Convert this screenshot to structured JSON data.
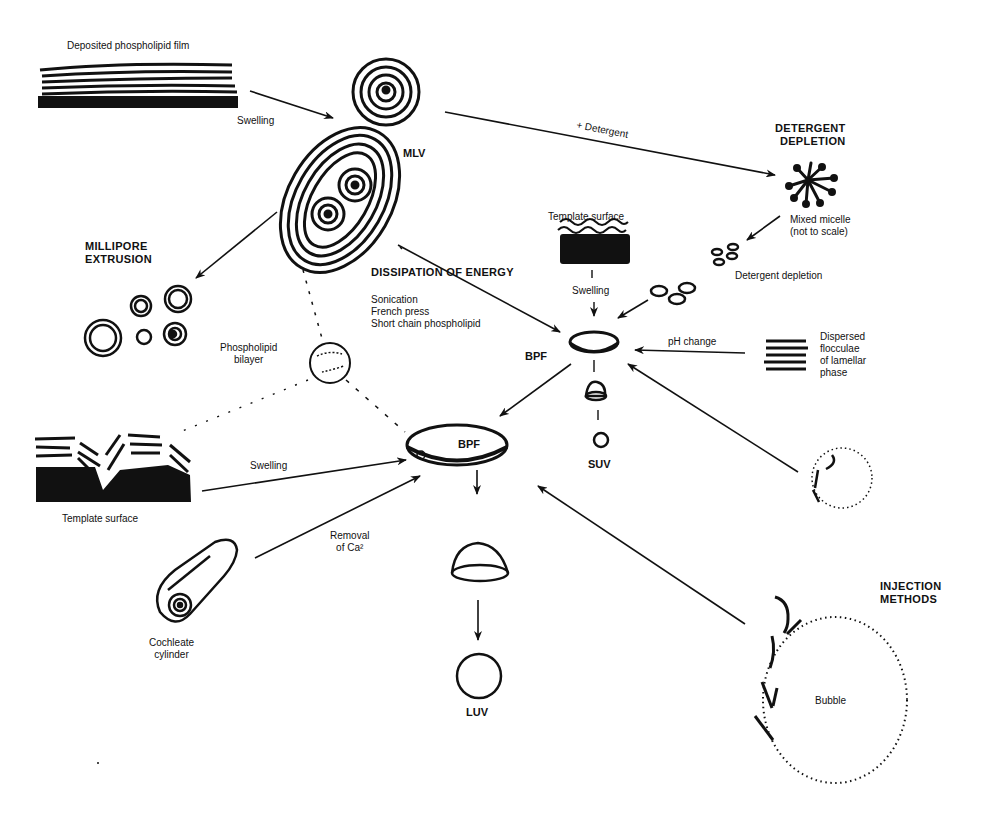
{
  "diagram": {
    "nodes": {
      "film": {
        "label": "Deposited phospholipid film"
      },
      "mlv_small": {
        "label": ""
      },
      "mlv": {
        "label": "MLV"
      },
      "millipore": {
        "label": "MILLIPORE\nEXTRUSION"
      },
      "detergent_header": {
        "label": "DETERGENT\nDEPLETION"
      },
      "mixed_micelle": {
        "label": "Mixed micelle\n(not to scale)"
      },
      "template_top": {
        "label": "Template surface"
      },
      "dissipation": {
        "label": "DISSIPATION OF ENERGY"
      },
      "dissipation_methods": {
        "items": [
          "Sonication",
          "French press",
          "Short chain phospholipid"
        ]
      },
      "bpf_small": {
        "label": "BPF"
      },
      "suv": {
        "label": "SUV"
      },
      "bilayer": {
        "label": "Phospholipid\nbilayer"
      },
      "flocculae": {
        "label": "Dispersed\nflocculae\nof lamellar\nphase"
      },
      "bpf_large": {
        "label": "BPF"
      },
      "template_bottom": {
        "label": "Template surface"
      },
      "cochleate": {
        "label": "Cochleate\ncylinder"
      },
      "luv": {
        "label": "LUV"
      },
      "injection": {
        "label": "INJECTION\nMETHODS"
      },
      "bubble": {
        "label": "Bubble"
      }
    },
    "edges": [
      {
        "from": "film",
        "to": "mlv_small",
        "label": "Swelling"
      },
      {
        "from": "mlv_small",
        "to": "mixed_micelle",
        "label": "+ Detergent"
      },
      {
        "from": "mixed_micelle",
        "to": "discs",
        "label": ""
      },
      {
        "from": "discs",
        "to": "bpf_small",
        "label": "Detergent depletion"
      },
      {
        "from": "template_top",
        "to": "bpf_small",
        "label": "Swelling"
      },
      {
        "from": "mlv",
        "to": "bpf_small",
        "label": "DISSIPATION OF ENERGY"
      },
      {
        "from": "mlv",
        "to": "millipore",
        "label": ""
      },
      {
        "from": "flocculae",
        "to": "bpf_small",
        "label": "pH change"
      },
      {
        "from": "injection_small",
        "to": "bpf_small",
        "label": ""
      },
      {
        "from": "bpf_small",
        "to": "bpf_large",
        "label": ""
      },
      {
        "from": "bpf_small",
        "to": "suv",
        "label": ""
      },
      {
        "from": "template_bottom",
        "to": "bpf_large",
        "label": "Swelling"
      },
      {
        "from": "cochleate",
        "to": "bpf_large",
        "label": "Removal\nof Ca²"
      },
      {
        "from": "bubble",
        "to": "bpf_large",
        "label": ""
      },
      {
        "from": "bpf_large",
        "to": "luv",
        "label": ""
      }
    ],
    "edge_labels": {
      "swelling_1": "Swelling",
      "detergent": "+ Detergent",
      "detergent_depletion": "Detergent depletion",
      "swelling_top": "Swelling",
      "ph_change": "pH change",
      "swelling_bottom": "Swelling",
      "removal_ca": "Removal\nof Ca²"
    },
    "colors": {
      "ink": "#111111",
      "background": "#ffffff"
    }
  }
}
